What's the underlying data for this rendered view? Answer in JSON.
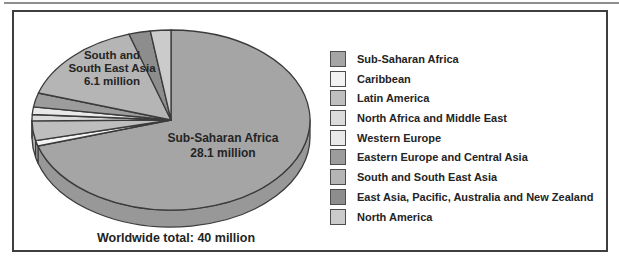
{
  "chart_data": {
    "type": "pie",
    "style": "3d-ellipse",
    "legend_position": "right",
    "total": 40,
    "slices": [
      {
        "label": "Sub-Saharan Africa",
        "value": 28.1,
        "color": "#a5a5a5"
      },
      {
        "label": "Caribbean",
        "value": 0.4,
        "color": "#f3f3f3"
      },
      {
        "label": "Latin America",
        "value": 1.4,
        "color": "#bebebe"
      },
      {
        "label": "North Africa and Middle East",
        "value": 0.45,
        "color": "#dbdbdb"
      },
      {
        "label": "Western Europe",
        "value": 0.55,
        "color": "#e9e9e9"
      },
      {
        "label": "Eastern Europe and Central Asia",
        "value": 1.0,
        "color": "#9c9c9c"
      },
      {
        "label": "South and South East Asia",
        "value": 6.1,
        "color": "#b5b5b5"
      },
      {
        "label": "East Asia, Pacific, Australia and New Zealand",
        "value": 1.0,
        "color": "#8d8d8d"
      },
      {
        "label": "North America",
        "value": 0.95,
        "color": "#cbcbcb"
      }
    ],
    "geometry": {
      "cx": 171,
      "cy": 120,
      "rx": 139,
      "ry": 90,
      "depth": 17,
      "start_angle_deg": 0,
      "direction": "clockwise"
    },
    "outline_color": "#3b3b3b"
  },
  "pie_labels": {
    "south_east_asia": {
      "line1": "South and",
      "line2": "South East Asia",
      "line3": "6.1 million"
    },
    "sub_saharan": {
      "line1": "Sub-Saharan Africa",
      "line2": "28.1 million"
    }
  },
  "footer": {
    "worldwide_total": "Worldwide total: 40 million"
  }
}
